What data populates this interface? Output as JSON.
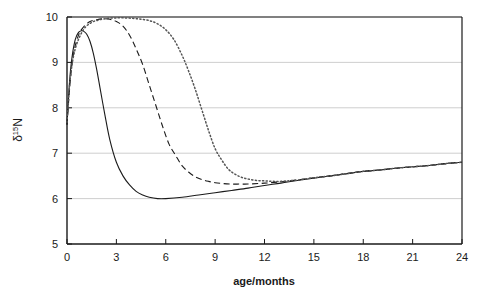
{
  "chart_data": {
    "type": "line",
    "title": "",
    "subtitle": "",
    "xlabel": "age/months",
    "ylabel": "δ¹⁵N",
    "ylabel_parts": {
      "delta": "δ",
      "superscript": "15",
      "element": "N"
    },
    "xlim": [
      0,
      24
    ],
    "ylim": [
      5,
      10
    ],
    "xticks": [
      0,
      3,
      6,
      9,
      12,
      15,
      18,
      21,
      24
    ],
    "xtick_labels": [
      "0",
      "3",
      "6",
      "9",
      "12",
      "15",
      "18",
      "21",
      "24"
    ],
    "yticks": [
      5,
      6,
      7,
      8,
      9,
      10
    ],
    "ytick_labels": [
      "5",
      "6",
      "7",
      "8",
      "9",
      "10"
    ],
    "grid": "horizontal",
    "grid_color": "#c8c8c8",
    "axis_color": "#1a1a1a",
    "legend": "none",
    "series": [
      {
        "name": "solid",
        "style": "solid",
        "color": "#1a1a1a",
        "x": [
          0,
          0.15,
          0.3,
          0.5,
          0.7,
          0.9,
          1.0,
          1.2,
          1.4,
          1.6,
          1.8,
          2.0,
          2.3,
          2.6,
          3.0,
          3.4,
          3.8,
          4.2,
          4.6,
          5.0,
          5.5,
          6.0,
          7.0,
          8.0,
          9.0,
          10.0,
          11.0,
          12.0,
          13.0,
          14.0,
          15.0,
          16.0,
          17.0,
          18.0,
          19.0,
          20.0,
          21.0,
          22.0,
          23.0,
          24.0
        ],
        "y": [
          7.62,
          8.55,
          9.1,
          9.5,
          9.66,
          9.7,
          9.69,
          9.62,
          9.46,
          9.2,
          8.85,
          8.45,
          7.85,
          7.3,
          6.8,
          6.5,
          6.3,
          6.16,
          6.08,
          6.03,
          6.0,
          6.0,
          6.03,
          6.08,
          6.13,
          6.18,
          6.23,
          6.29,
          6.34,
          6.4,
          6.45,
          6.5,
          6.55,
          6.6,
          6.63,
          6.67,
          6.7,
          6.73,
          6.77,
          6.8
        ]
      },
      {
        "name": "dashed",
        "style": "dashed",
        "color": "#1a1a1a",
        "x": [
          0,
          0.2,
          0.4,
          0.7,
          1.0,
          1.4,
          1.8,
          2.2,
          2.6,
          3.0,
          3.4,
          3.8,
          4.2,
          4.6,
          5.0,
          5.4,
          5.8,
          6.2,
          6.6,
          7.0,
          7.4,
          7.8,
          8.2,
          8.6,
          9.0,
          9.5,
          10.0,
          10.5,
          11.0,
          12.0,
          13.0,
          14.0,
          15.0,
          16.0,
          17.0,
          18.0,
          19.0,
          20.0,
          21.0,
          22.0,
          23.0,
          24.0
        ],
        "y": [
          7.65,
          8.6,
          9.2,
          9.6,
          9.78,
          9.9,
          9.94,
          9.96,
          9.95,
          9.9,
          9.8,
          9.6,
          9.3,
          8.95,
          8.5,
          8.05,
          7.6,
          7.2,
          6.95,
          6.72,
          6.58,
          6.48,
          6.42,
          6.38,
          6.35,
          6.33,
          6.32,
          6.32,
          6.32,
          6.34,
          6.37,
          6.41,
          6.46,
          6.5,
          6.55,
          6.6,
          6.63,
          6.67,
          6.7,
          6.73,
          6.77,
          6.8
        ]
      },
      {
        "name": "dotted",
        "style": "dotted",
        "color": "#555555",
        "x": [
          0,
          0.2,
          0.5,
          1.0,
          1.5,
          2.0,
          2.5,
          3.0,
          3.5,
          4.0,
          4.5,
          5.0,
          5.5,
          6.0,
          6.5,
          7.0,
          7.4,
          7.8,
          8.2,
          8.6,
          9.0,
          9.4,
          9.8,
          10.2,
          10.6,
          11.0,
          11.5,
          12.0,
          12.5,
          13.0,
          14.0,
          15.0,
          16.0,
          17.0,
          18.0,
          19.0,
          20.0,
          21.0,
          22.0,
          23.0,
          24.0
        ],
        "y": [
          7.68,
          8.65,
          9.3,
          9.72,
          9.88,
          9.94,
          9.97,
          9.98,
          9.98,
          9.97,
          9.95,
          9.92,
          9.85,
          9.72,
          9.5,
          9.15,
          8.8,
          8.4,
          7.95,
          7.5,
          7.1,
          6.85,
          6.65,
          6.54,
          6.47,
          6.43,
          6.4,
          6.39,
          6.38,
          6.38,
          6.41,
          6.46,
          6.5,
          6.55,
          6.6,
          6.63,
          6.67,
          6.7,
          6.73,
          6.77,
          6.8
        ]
      }
    ]
  },
  "axes": {
    "x_title": "age/months",
    "y_title_delta": "δ",
    "y_title_sup": "15",
    "y_title_elem": "N"
  }
}
